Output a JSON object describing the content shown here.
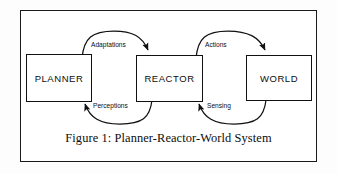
{
  "figure": {
    "caption": "Figure 1: Planner-Reactor-World System",
    "border_color": "#1a1a1a",
    "background": "#ffffff"
  },
  "diagram": {
    "type": "block-flow-diagram",
    "nodes": [
      {
        "id": "planner",
        "label": "PLANNER"
      },
      {
        "id": "reactor",
        "label": "REACTOR"
      },
      {
        "id": "world",
        "label": "WORLD"
      }
    ],
    "edges": [
      {
        "id": "adaptations",
        "label": "Adaptations",
        "from": "planner",
        "to": "reactor",
        "direction": "right",
        "arc": "over"
      },
      {
        "id": "perceptions",
        "label": "Perceptions",
        "from": "reactor",
        "to": "planner",
        "direction": "left",
        "arc": "under"
      },
      {
        "id": "actions",
        "label": "Actions",
        "from": "reactor",
        "to": "world",
        "direction": "right",
        "arc": "over"
      },
      {
        "id": "sensing",
        "label": "Sensing",
        "from": "world",
        "to": "reactor",
        "direction": "left",
        "arc": "under"
      }
    ],
    "line_color": "#111111"
  }
}
